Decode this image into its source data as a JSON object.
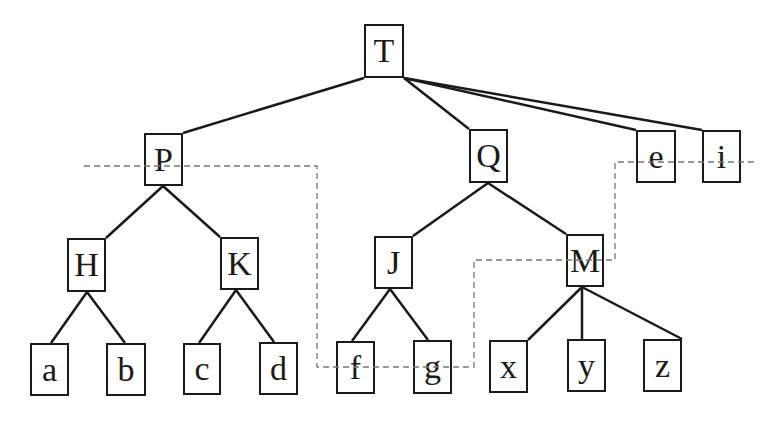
{
  "diagram": {
    "type": "tree",
    "colors": {
      "stroke": "#1a1a1a",
      "dashed": "#777777",
      "background": "#ffffff"
    },
    "nodes": [
      {
        "id": "T",
        "label": "T",
        "x": 364,
        "y": 24,
        "w": 40,
        "h": 54
      },
      {
        "id": "P",
        "label": "P",
        "x": 144,
        "y": 133,
        "w": 39,
        "h": 53
      },
      {
        "id": "Q",
        "label": "Q",
        "x": 469,
        "y": 129,
        "w": 39,
        "h": 54
      },
      {
        "id": "e",
        "label": "e",
        "x": 636,
        "y": 130,
        "w": 40,
        "h": 53
      },
      {
        "id": "i",
        "label": "i",
        "x": 702,
        "y": 130,
        "w": 39,
        "h": 53
      },
      {
        "id": "H",
        "label": "H",
        "x": 67,
        "y": 238,
        "w": 39,
        "h": 54
      },
      {
        "id": "K",
        "label": "K",
        "x": 220,
        "y": 237,
        "w": 39,
        "h": 53
      },
      {
        "id": "J",
        "label": "J",
        "x": 374,
        "y": 236,
        "w": 39,
        "h": 53
      },
      {
        "id": "M",
        "label": "M",
        "x": 566,
        "y": 234,
        "w": 38,
        "h": 53
      },
      {
        "id": "a",
        "label": "a",
        "x": 30,
        "y": 343,
        "w": 39,
        "h": 53
      },
      {
        "id": "b",
        "label": "b",
        "x": 106,
        "y": 343,
        "w": 40,
        "h": 53
      },
      {
        "id": "c",
        "label": "c",
        "x": 183,
        "y": 343,
        "w": 38,
        "h": 52
      },
      {
        "id": "d",
        "label": "d",
        "x": 259,
        "y": 342,
        "w": 39,
        "h": 53
      },
      {
        "id": "f",
        "label": "f",
        "x": 336,
        "y": 341,
        "w": 39,
        "h": 53
      },
      {
        "id": "g",
        "label": "g",
        "x": 413,
        "y": 340,
        "w": 39,
        "h": 54
      },
      {
        "id": "x",
        "label": "x",
        "x": 489,
        "y": 340,
        "w": 39,
        "h": 53
      },
      {
        "id": "y",
        "label": "y",
        "x": 567,
        "y": 339,
        "w": 39,
        "h": 53
      },
      {
        "id": "z",
        "label": "z",
        "x": 643,
        "y": 339,
        "w": 39,
        "h": 53
      }
    ],
    "edges": [
      {
        "from": "T",
        "to": "P",
        "x1": 364,
        "y1": 78,
        "x2": 183,
        "y2": 133
      },
      {
        "from": "T",
        "to": "Q",
        "x1": 404,
        "y1": 78,
        "x2": 469,
        "y2": 129
      },
      {
        "from": "T",
        "to": "e",
        "x1": 404,
        "y1": 78,
        "x2": 636,
        "y2": 130
      },
      {
        "from": "T",
        "to": "i",
        "x1": 404,
        "y1": 78,
        "x2": 702,
        "y2": 130
      },
      {
        "from": "P",
        "to": "H",
        "x1": 163,
        "y1": 186,
        "x2": 106,
        "y2": 238
      },
      {
        "from": "P",
        "to": "K",
        "x1": 163,
        "y1": 186,
        "x2": 220,
        "y2": 237
      },
      {
        "from": "Q",
        "to": "J",
        "x1": 488,
        "y1": 183,
        "x2": 413,
        "y2": 236
      },
      {
        "from": "Q",
        "to": "M",
        "x1": 488,
        "y1": 183,
        "x2": 566,
        "y2": 234
      },
      {
        "from": "H",
        "to": "a",
        "x1": 87,
        "y1": 292,
        "x2": 51,
        "y2": 343
      },
      {
        "from": "H",
        "to": "b",
        "x1": 87,
        "y1": 292,
        "x2": 125,
        "y2": 343
      },
      {
        "from": "K",
        "to": "c",
        "x1": 236,
        "y1": 290,
        "x2": 199,
        "y2": 343
      },
      {
        "from": "K",
        "to": "d",
        "x1": 236,
        "y1": 290,
        "x2": 274,
        "y2": 342
      },
      {
        "from": "J",
        "to": "f",
        "x1": 390,
        "y1": 289,
        "x2": 352,
        "y2": 341
      },
      {
        "from": "J",
        "to": "g",
        "x1": 390,
        "y1": 289,
        "x2": 428,
        "y2": 340
      },
      {
        "from": "M",
        "to": "x",
        "x1": 582,
        "y1": 287,
        "x2": 528,
        "y2": 340
      },
      {
        "from": "M",
        "to": "y",
        "x1": 582,
        "y1": 287,
        "x2": 582,
        "y2": 339
      },
      {
        "from": "M",
        "to": "z",
        "x1": 582,
        "y1": 287,
        "x2": 682,
        "y2": 339
      }
    ],
    "dashed_path": "84,166 317,166 317,367 474,367 474,260 615,260 615,162 757,162"
  }
}
